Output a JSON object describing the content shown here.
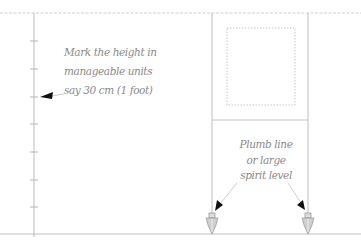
{
  "diagram": {
    "colors": {
      "line": "#c4c4c4",
      "dotted": "#c8c8c8",
      "text": "#8a8a8a",
      "arrow": "#111111",
      "plumb_fill": "#cfcfcf",
      "plumb_stroke": "#9a9a9a"
    },
    "annotations": {
      "measure": {
        "lines": [
          "Mark the height in",
          "manageable units",
          "say 30 cm (1 foot)"
        ]
      },
      "plumb": {
        "lines": [
          "Plumb line",
          "or large",
          "spirit level"
        ]
      }
    },
    "measuring_rod": {
      "x": 34,
      "tick_count": 7,
      "ticks_y": [
        41,
        69,
        97,
        124,
        152,
        180,
        207
      ]
    },
    "window": {
      "frame_left_x": 212,
      "frame_right_x": 308,
      "sill_y": 120,
      "opening": {
        "x": 227,
        "y": 28,
        "width": 68,
        "height": 77
      }
    },
    "ground_y": 234,
    "ceiling_y": 13,
    "plumb_bobs": [
      {
        "name": "left",
        "x": 212
      },
      {
        "name": "right",
        "x": 308
      }
    ]
  }
}
